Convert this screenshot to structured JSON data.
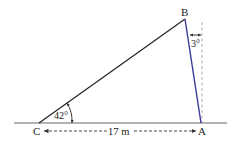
{
  "diagram": {
    "type": "geometry-triangle",
    "points": {
      "A": {
        "label": "A",
        "x": 201,
        "y": 123
      },
      "B": {
        "label": "B",
        "x": 185,
        "y": 19
      },
      "C": {
        "label": "C",
        "x": 39,
        "y": 123
      }
    },
    "angles": {
      "at_C": {
        "label": "42°",
        "value_deg": 42
      },
      "tilt_at_B": {
        "label": "3°",
        "value_deg": 3
      }
    },
    "measurements": {
      "CA": {
        "label": "17 m",
        "value": 17,
        "unit": "m"
      }
    },
    "colors": {
      "ground": "#555555",
      "side_CB": "#222222",
      "side_BA": "#3a3a9a",
      "vertical_dashed": "#999999",
      "dimension": "#333333"
    }
  }
}
